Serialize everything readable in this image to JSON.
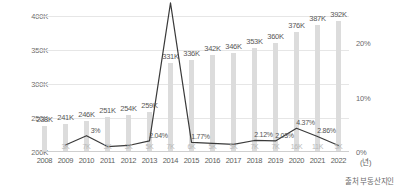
{
  "chart_data": {
    "type": "bar",
    "title": "",
    "subtitle": "",
    "xlabel": "(년)",
    "ylabel": "",
    "y2label": "",
    "grid": true,
    "legend": "none",
    "categories": [
      "2008",
      "2009",
      "2010",
      "2011",
      "2012",
      "2013",
      "2014",
      "2015",
      "2016",
      "2017",
      "2018",
      "2019",
      "2020",
      "2021",
      "2022"
    ],
    "ylim": [
      200000,
      400000
    ],
    "yticks": [
      "200K",
      "250K",
      "300K",
      "350K",
      "400K"
    ],
    "y2lim": [
      0,
      25
    ],
    "y2ticks": [
      "0%",
      "10%",
      "20%"
    ],
    "series": [
      {
        "name": "세대수",
        "type": "bar",
        "axis": "left",
        "values": [
          238000,
          241000,
          246000,
          251000,
          254000,
          259000,
          331000,
          336000,
          342000,
          346000,
          353000,
          360000,
          376000,
          387000,
          392000
        ],
        "labels": [
          "238K",
          "241K",
          "246K",
          "251K",
          "254K",
          "259K",
          "331K",
          "336K",
          "342K",
          "346K",
          "353K",
          "360K",
          "376K",
          "387K",
          "392K"
        ]
      },
      {
        "name": "증가율",
        "type": "line",
        "axis": "right",
        "values": [
          null,
          1.3,
          3.0,
          1.0,
          1.2,
          2.04,
          27.4,
          1.77,
          1.6,
          1.4,
          2.12,
          2.03,
          4.37,
          2.86,
          1.2
        ],
        "labels": [
          "",
          "",
          "3%",
          "",
          "",
          "2.04%",
          "27.4%",
          "1.77%",
          "",
          "",
          "2.12%",
          "2.03%",
          "4.37%",
          "2.86%",
          ""
        ],
        "minor_labels": [
          "",
          "3K",
          "7K",
          "3K",
          "3K",
          "5K",
          "7K",
          "6K",
          "5K",
          "5K",
          "7K",
          "7K",
          "16K",
          "11K",
          "5K"
        ]
      }
    ]
  },
  "footer": {
    "source": "출처 부동산지인"
  },
  "colors": {
    "bar": "#dcdcdc",
    "line": "#3a3a3a",
    "grid": "#e6e6e6",
    "text": "#585858",
    "muted": "#b9b9b9"
  }
}
